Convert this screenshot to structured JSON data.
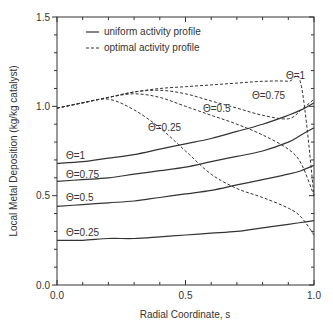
{
  "chart_data": {
    "type": "line",
    "title": "",
    "xlabel": "Radial Coordinate, s",
    "ylabel": "Local Metal Deposition (kg/kg catalyst)",
    "xlim": [
      0.0,
      1.0
    ],
    "ylim": [
      0.0,
      1.5
    ],
    "x_ticks": [
      "0.0",
      "0.5",
      "1.0"
    ],
    "y_ticks": [
      "0.0",
      "0.5",
      "1.0",
      "1.5"
    ],
    "grid": false,
    "legend_position": "upper-left-inside",
    "legend": [
      {
        "label": "uniform activity profile",
        "style": "solid"
      },
      {
        "label": "optimal activity profile",
        "style": "dashed"
      }
    ],
    "x": [
      0.0,
      0.1,
      0.2,
      0.3,
      0.4,
      0.5,
      0.6,
      0.7,
      0.8,
      0.9,
      0.95,
      1.0
    ],
    "series": [
      {
        "name": "uniform, Θ=1",
        "style": "solid",
        "label": "Θ=1",
        "values": [
          0.68,
          0.69,
          0.71,
          0.73,
          0.76,
          0.79,
          0.82,
          0.86,
          0.9,
          0.95,
          0.98,
          1.02
        ]
      },
      {
        "name": "uniform, Θ=0.75",
        "style": "solid",
        "label": "Θ=0.75",
        "values": [
          0.58,
          0.59,
          0.6,
          0.62,
          0.64,
          0.66,
          0.69,
          0.72,
          0.75,
          0.8,
          0.84,
          0.88
        ]
      },
      {
        "name": "uniform, Θ=0.5",
        "style": "solid",
        "label": "Θ=0.5",
        "values": [
          0.44,
          0.45,
          0.46,
          0.47,
          0.49,
          0.51,
          0.53,
          0.56,
          0.59,
          0.62,
          0.64,
          0.67
        ]
      },
      {
        "name": "uniform, Θ=0.25",
        "style": "solid",
        "label": "Θ=0.25",
        "values": [
          0.25,
          0.25,
          0.26,
          0.26,
          0.27,
          0.28,
          0.29,
          0.3,
          0.32,
          0.34,
          0.35,
          0.36
        ]
      },
      {
        "name": "optimal, Θ=1",
        "style": "dashed",
        "label": "Θ=1",
        "values": [
          0.99,
          1.02,
          1.05,
          1.08,
          1.1,
          1.11,
          1.12,
          1.13,
          1.14,
          1.14,
          1.12,
          0.5
        ]
      },
      {
        "name": "optimal, Θ=0.75",
        "style": "dashed",
        "label": "Θ=0.75",
        "values": [
          0.99,
          1.02,
          1.05,
          1.08,
          1.09,
          1.07,
          1.03,
          0.99,
          0.95,
          0.93,
          0.98,
          1.04
        ]
      },
      {
        "name": "optimal, Θ=0.5",
        "style": "dashed",
        "label": "Θ=0.5",
        "values": [
          0.99,
          1.02,
          1.05,
          1.07,
          1.05,
          1.0,
          0.95,
          0.9,
          0.84,
          0.76,
          0.68,
          0.5
        ]
      },
      {
        "name": "optimal, Θ=0.25",
        "style": "dashed",
        "label": "Θ=0.25",
        "values": [
          0.99,
          1.02,
          1.04,
          0.98,
          0.88,
          0.75,
          0.62,
          0.54,
          0.49,
          0.43,
          0.38,
          0.28
        ]
      }
    ]
  }
}
